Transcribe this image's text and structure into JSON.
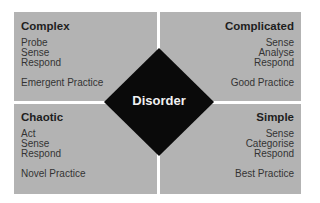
{
  "diagram": {
    "type": "cynefin-framework",
    "quadrants": [
      {
        "id": "complex",
        "title": "Complex",
        "steps": [
          "Probe",
          "Sense",
          "Respond"
        ],
        "practice": "Emergent Practice",
        "position": "top-left"
      },
      {
        "id": "complicated",
        "title": "Complicated",
        "steps": [
          "Sense",
          "Analyse",
          "Respond"
        ],
        "practice": "Good Practice",
        "position": "top-right"
      },
      {
        "id": "chaotic",
        "title": "Chaotic",
        "steps": [
          "Act",
          "Sense",
          "Respond"
        ],
        "practice": "Novel Practice",
        "position": "bottom-left"
      },
      {
        "id": "simple",
        "title": "Simple",
        "steps": [
          "Sense",
          "Categorise",
          "Respond"
        ],
        "practice": "Best Practice",
        "position": "bottom-right"
      }
    ],
    "center": {
      "label": "Disorder"
    },
    "colors": {
      "quadrant_fill": "#b3b3b3",
      "center_fill": "#0a0a0a",
      "center_text": "#f2f2f2",
      "divider": "#ffffff"
    }
  }
}
